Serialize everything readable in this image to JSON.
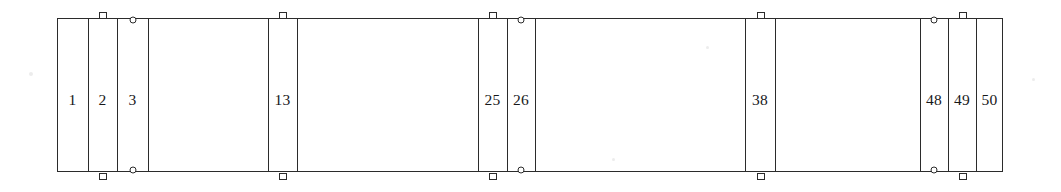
{
  "diagram": {
    "type": "linear-bay-elevation",
    "units": "px",
    "stroke_color": "#2b2b2b",
    "fill_color": "#ffffff",
    "background_color": "#ffffff",
    "frame": {
      "x": 57,
      "y": 18,
      "width": 946,
      "height": 154
    },
    "dividers_x": [
      88,
      117,
      148,
      268,
      297,
      478,
      507,
      535,
      745,
      775,
      920,
      948,
      976
    ],
    "bays": [
      {
        "label": "1",
        "x": 57,
        "width": 31,
        "center_x": 72.5,
        "center_y": 100
      },
      {
        "label": "2",
        "x": 88,
        "width": 29,
        "center_x": 102.5,
        "center_y": 100
      },
      {
        "label": "3",
        "x": 117,
        "width": 31,
        "center_x": 132.5,
        "center_y": 100
      },
      {
        "label": "13",
        "x": 268,
        "width": 29,
        "center_x": 282.5,
        "center_y": 100
      },
      {
        "label": "25",
        "x": 478,
        "width": 29,
        "center_x": 492.5,
        "center_y": 100
      },
      {
        "label": "26",
        "x": 507,
        "width": 28,
        "center_x": 521.0,
        "center_y": 100
      },
      {
        "label": "38",
        "x": 745,
        "width": 30,
        "center_x": 760.0,
        "center_y": 100
      },
      {
        "label": "48",
        "x": 920,
        "width": 28,
        "center_x": 934.0,
        "center_y": 100
      },
      {
        "label": "49",
        "x": 948,
        "width": 28,
        "center_x": 962.0,
        "center_y": 100
      },
      {
        "label": "50",
        "x": 976,
        "width": 27,
        "center_x": 989.5,
        "center_y": 100
      }
    ],
    "markers": {
      "square_top": [
        {
          "x": 103,
          "y": 12
        },
        {
          "x": 283,
          "y": 12
        },
        {
          "x": 493,
          "y": 12
        },
        {
          "x": 761,
          "y": 12
        },
        {
          "x": 963,
          "y": 12
        }
      ],
      "square_bottom": [
        {
          "x": 103,
          "y": 173
        },
        {
          "x": 283,
          "y": 173
        },
        {
          "x": 493,
          "y": 173
        },
        {
          "x": 761,
          "y": 173
        },
        {
          "x": 963,
          "y": 173
        }
      ],
      "circle_top": [
        {
          "x": 133,
          "y": 20
        },
        {
          "x": 521,
          "y": 20
        },
        {
          "x": 934,
          "y": 20
        }
      ],
      "circle_bottom": [
        {
          "x": 133,
          "y": 170
        },
        {
          "x": 521,
          "y": 170
        },
        {
          "x": 934,
          "y": 170
        }
      ]
    },
    "specks": [
      {
        "x": 29,
        "y": 72,
        "size": 4
      },
      {
        "x": 1032,
        "y": 78,
        "size": 3
      },
      {
        "x": 706,
        "y": 46,
        "size": 3
      },
      {
        "x": 612,
        "y": 158,
        "size": 3
      }
    ]
  }
}
